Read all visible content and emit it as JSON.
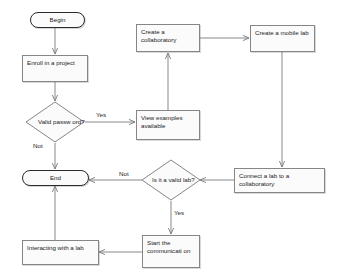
{
  "diagram": {
    "background_color": "#ffffff",
    "node_fill": "#fbfbfb",
    "node_stroke": "#868686",
    "terminator_stroke": "#2b2b2b",
    "edge_stroke": "#7a7a7a",
    "text_color": "#1a1a1a"
  },
  "nodes": {
    "begin": {
      "label": "Begin",
      "shape": "terminator"
    },
    "enroll": {
      "label": "Enroll in a project",
      "shape": "process"
    },
    "valid_password": {
      "label": "Valid passw ord?",
      "shape": "decision"
    },
    "end": {
      "label": "End",
      "shape": "terminator"
    },
    "interacting": {
      "label": "Interacting with a lab",
      "shape": "process"
    },
    "view_examples": {
      "label": "View examples available",
      "shape": "process"
    },
    "create_collaboratory": {
      "label": "Create a collaboratory",
      "shape": "process"
    },
    "create_mobile_lab": {
      "label": "Create a mobile lab",
      "shape": "process"
    },
    "connect_lab": {
      "label": "Connect a lab to a collaboratory",
      "shape": "process"
    },
    "valid_lab": {
      "label": "Is it a valid lab?",
      "shape": "decision"
    },
    "start_communication": {
      "label": "Start the communicati on",
      "shape": "process"
    }
  },
  "edge_labels": {
    "password_yes": "Yes",
    "password_not": "Not",
    "lab_not": "Not",
    "lab_yes": "Yes"
  }
}
